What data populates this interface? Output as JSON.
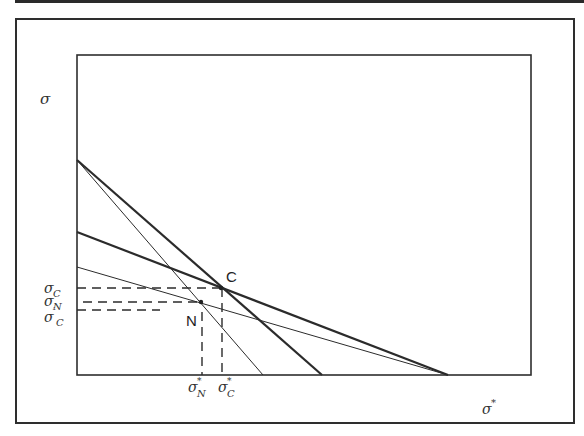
{
  "diagram": {
    "y_axis_label": "σ",
    "x_axis_label": "σ*",
    "points": {
      "C": {
        "label": "C",
        "x": 221,
        "y": 288
      },
      "N": {
        "label": "N",
        "x": 201,
        "y": 302
      }
    },
    "y_ticks": [
      {
        "base": "σ",
        "sub": "C",
        "sup": "",
        "y": 288
      },
      {
        "base": "σ",
        "sub": "N",
        "sup": "",
        "y": 302
      },
      {
        "base": "σ",
        "sub": "C",
        "sup": "′",
        "y": 312
      }
    ],
    "x_ticks": [
      {
        "base": "σ",
        "sub": "N",
        "sup": "*",
        "x": 202
      },
      {
        "base": "σ",
        "sub": "C",
        "sup": "*",
        "x": 222
      }
    ],
    "lines": [
      {
        "name": "thick-line-steep",
        "x1": 77,
        "y1": 160,
        "x2": 322,
        "y2": 375,
        "width": 2.2
      },
      {
        "name": "thin-line-steep",
        "x1": 77,
        "y1": 160,
        "x2": 263,
        "y2": 375,
        "width": 1
      },
      {
        "name": "thick-line-flat",
        "x1": 77,
        "y1": 232,
        "x2": 448,
        "y2": 375,
        "width": 2.2
      },
      {
        "name": "thin-line-flat",
        "x1": 77,
        "y1": 267,
        "x2": 448,
        "y2": 375,
        "width": 1
      }
    ],
    "colors": {
      "line": "#2b2b2b",
      "frame": "#2e2e2e",
      "text": "#333333"
    }
  }
}
